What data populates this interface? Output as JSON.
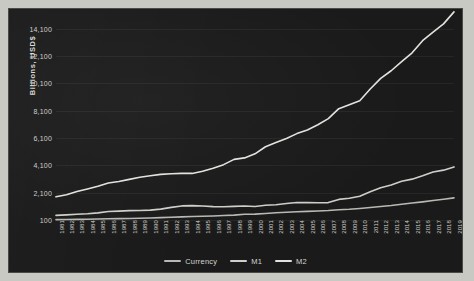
{
  "chart_data": {
    "type": "line",
    "title": "",
    "xlabel": "",
    "ylabel": "Billions, USD$",
    "ylim": [
      100,
      15100
    ],
    "yticks": [
      "100",
      "2,100",
      "4,100",
      "6,100",
      "8,100",
      "10,100",
      "12,100",
      "14,100"
    ],
    "ytick_values": [
      100,
      2100,
      4100,
      6100,
      8100,
      10100,
      12100,
      14100
    ],
    "grid": true,
    "legend_position": "bottom",
    "x": [
      1981,
      1982,
      1983,
      1984,
      1985,
      1986,
      1987,
      1988,
      1989,
      1990,
      1991,
      1992,
      1993,
      1994,
      1995,
      1996,
      1997,
      1998,
      1999,
      2000,
      2001,
      2002,
      2003,
      2004,
      2005,
      2006,
      2007,
      2008,
      2009,
      2010,
      2011,
      2012,
      2013,
      2014,
      2015,
      2016,
      2017,
      2018,
      2019
    ],
    "categories": [
      "1981",
      "1982",
      "1983",
      "1984",
      "1985",
      "1986",
      "1987",
      "1988",
      "1989",
      "1990",
      "1991",
      "1992",
      "1993",
      "1994",
      "1995",
      "1996",
      "1997",
      "1998",
      "1999",
      "2000",
      "2001",
      "2002",
      "2003",
      "2004",
      "2005",
      "2006",
      "2007",
      "2008",
      "2009",
      "2010",
      "2011",
      "2012",
      "2013",
      "2014",
      "2015",
      "2016",
      "2017",
      "2018",
      "2019"
    ],
    "series": [
      {
        "name": "Currency",
        "color": "#b9b9b4",
        "values": [
          124,
          133,
          145,
          158,
          171,
          187,
          203,
          213,
          225,
          248,
          275,
          299,
          327,
          356,
          374,
          395,
          425,
          456,
          517,
          532,
          581,
          627,
          663,
          700,
          733,
          764,
          792,
          853,
          887,
          942,
          1014,
          1092,
          1163,
          1252,
          1340,
          1425,
          1521,
          1624,
          1716
        ]
      },
      {
        "name": "M1",
        "color": "#cfcfca",
        "values": [
          441,
          478,
          523,
          552,
          620,
          725,
          750,
          787,
          794,
          826,
          898,
          1025,
          1130,
          1151,
          1129,
          1081,
          1073,
          1097,
          1124,
          1088,
          1183,
          1220,
          1306,
          1376,
          1375,
          1367,
          1375,
          1607,
          1695,
          1837,
          2165,
          2460,
          2663,
          2939,
          3090,
          3338,
          3606,
          3748,
          3983
        ]
      },
      {
        "name": "M2",
        "color": "#e3e3de",
        "values": [
          1795,
          1954,
          2186,
          2374,
          2569,
          2811,
          2911,
          3071,
          3227,
          3339,
          3439,
          3487,
          3508,
          3508,
          3672,
          3892,
          4151,
          4537,
          4645,
          4939,
          5461,
          5773,
          6066,
          6421,
          6692,
          7073,
          7521,
          8247,
          8529,
          8823,
          9682,
          10463,
          11022,
          11686,
          12334,
          13223,
          13855,
          14450,
          15328
        ]
      }
    ]
  },
  "legend": {
    "items": [
      {
        "label": "Currency",
        "color": "#b9b9b4"
      },
      {
        "label": "M1",
        "color": "#cfcfca"
      },
      {
        "label": "M2",
        "color": "#e3e3de"
      }
    ]
  }
}
